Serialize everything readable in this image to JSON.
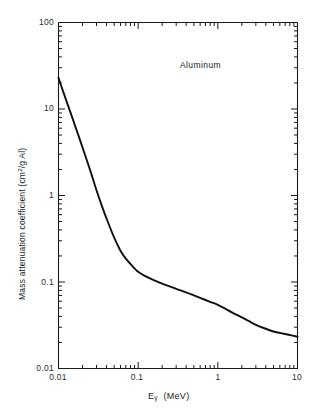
{
  "chart_data": {
    "type": "line",
    "title": "",
    "annotation": "Aluminum",
    "xlabel": "E_gamma  (MeV)",
    "xlabel_main": "E",
    "xlabel_sub": "γ",
    "xlabel_unit": "(MeV)",
    "ylabel_main": "Mass attenuation coefficient  (cm",
    "ylabel_sup": "2",
    "ylabel_tail": "/g Al)",
    "xscale": "log",
    "yscale": "log",
    "xlim": [
      0.01,
      10
    ],
    "ylim": [
      0.01,
      100
    ],
    "grid": false,
    "legend": "none",
    "xticks": [
      0.01,
      0.1,
      1,
      10
    ],
    "xtick_labels": [
      "0.01",
      "0.1",
      "1",
      "10"
    ],
    "yticks": [
      0.01,
      0.1,
      1,
      10,
      100
    ],
    "ytick_labels": [
      "0.01",
      "0.1",
      "1",
      "10",
      "100"
    ],
    "series": [
      {
        "name": "Aluminum mass attenuation coefficient",
        "x": [
          0.01,
          0.012,
          0.015,
          0.018,
          0.02,
          0.025,
          0.03,
          0.035,
          0.04,
          0.05,
          0.06,
          0.07,
          0.08,
          0.1,
          0.125,
          0.15,
          0.2,
          0.3,
          0.4,
          0.5,
          0.6,
          0.8,
          1.0,
          1.25,
          1.5,
          2.0,
          3.0,
          4.0,
          5.0,
          6.0,
          8.0,
          10.0
        ],
        "y": [
          23.0,
          14.0,
          7.8,
          4.8,
          3.6,
          1.95,
          1.15,
          0.76,
          0.545,
          0.325,
          0.23,
          0.186,
          0.162,
          0.131,
          0.116,
          0.107,
          0.0955,
          0.0835,
          0.076,
          0.07,
          0.0655,
          0.059,
          0.0545,
          0.049,
          0.0445,
          0.039,
          0.032,
          0.0288,
          0.0268,
          0.0258,
          0.0244,
          0.0233
        ]
      }
    ]
  },
  "axes": {
    "x_tick_minor_label_hint": "log minor ticks 2-9 per decade",
    "y_tick_minor_label_hint": "log minor ticks 2-9 per decade"
  }
}
